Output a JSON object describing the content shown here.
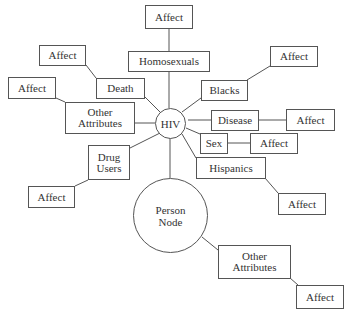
{
  "diagram": {
    "center": {
      "label": "HIV"
    },
    "person_node": {
      "label": "Person\nNode"
    },
    "attributes": [
      {
        "id": "homosexuals",
        "label": "Homosexuals",
        "affect": "Affect"
      },
      {
        "id": "death",
        "label": "Death",
        "affect": "Affect"
      },
      {
        "id": "other_left",
        "label": "Other\nAttributes",
        "affect": "Affect"
      },
      {
        "id": "drug_users",
        "label": "Drug\nUsers",
        "affect": "Affect"
      },
      {
        "id": "blacks",
        "label": "Blacks",
        "affect": "Affect"
      },
      {
        "id": "disease",
        "label": "Disease",
        "affect": "Affect"
      },
      {
        "id": "sex",
        "label": "Sex",
        "affect": "Affect"
      },
      {
        "id": "hispanics",
        "label": "Hispanics",
        "affect": "Affect"
      }
    ],
    "person_attributes": [
      {
        "id": "other_right",
        "label": "Other\nAttributes",
        "affect": "Affect"
      }
    ],
    "colors": {
      "stroke": "#555555",
      "text": "#333333",
      "background": "#ffffff"
    }
  }
}
